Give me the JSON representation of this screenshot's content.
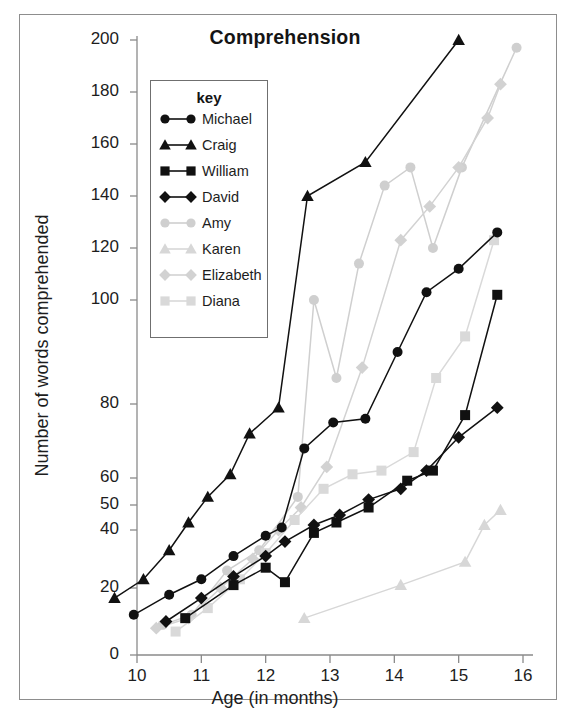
{
  "chart_data": {
    "type": "line",
    "title": "Comprehension",
    "xlabel": "Age (in months)",
    "ylabel": "Number of words comprehended",
    "xlim": [
      9.45,
      16.15
    ],
    "ylim": [
      0,
      200
    ],
    "grid": false,
    "legend_position": "upper-left-inside",
    "legend_title": "key",
    "x_ticks": [
      10,
      11,
      12,
      13,
      14,
      15,
      16
    ],
    "x_tick_labels": [
      "10",
      "11",
      "12",
      "13",
      "14",
      "15",
      "16"
    ],
    "y_ticks": [
      0,
      20,
      40,
      50,
      60,
      80,
      100,
      120,
      140,
      160,
      180,
      200
    ],
    "y_tick_labels": [
      "0",
      "20",
      "40",
      "50",
      "60",
      "80",
      "100",
      "120",
      "140",
      "160",
      "180",
      "200"
    ],
    "y_axis_note": "non-linear spacing, compressed near zero",
    "series": [
      {
        "name": "Michael",
        "marker": "circle",
        "color": "#111111",
        "x": [
          9.95,
          10.5,
          11.0,
          11.5,
          12.0,
          12.25,
          12.6,
          13.05,
          13.55,
          14.05,
          14.5,
          15.0,
          15.6
        ],
        "y": [
          12,
          18,
          23,
          31,
          38,
          41,
          68,
          75,
          76,
          90,
          103,
          112,
          126
        ]
      },
      {
        "name": "Craig",
        "marker": "triangle",
        "color": "#111111",
        "x": [
          9.65,
          10.1,
          10.5,
          10.8,
          11.1,
          11.45,
          11.75,
          12.2,
          12.65,
          13.55,
          15.0
        ],
        "y": [
          17,
          23,
          33,
          43,
          53,
          61,
          72,
          79,
          140,
          153,
          201
        ]
      },
      {
        "name": "William",
        "marker": "square",
        "color": "#111111",
        "x": [
          10.75,
          11.5,
          12.0,
          12.3,
          12.75,
          13.1,
          13.6,
          14.2,
          14.6,
          15.1,
          15.6
        ],
        "y": [
          11,
          21,
          27,
          22,
          39,
          43,
          49,
          59,
          62,
          77,
          102
        ]
      },
      {
        "name": "David",
        "marker": "diamond",
        "color": "#111111",
        "x": [
          10.45,
          11.0,
          11.5,
          12.0,
          12.3,
          12.75,
          13.15,
          13.6,
          14.1,
          14.5,
          15.0,
          15.6
        ],
        "y": [
          10,
          17,
          24,
          31,
          36,
          42,
          46,
          52,
          56,
          62,
          71,
          79
        ]
      },
      {
        "name": "Amy",
        "marker": "circle",
        "color": "#cfcfcf",
        "x": [
          10.4,
          10.85,
          11.4,
          11.9,
          12.5,
          12.75,
          13.1,
          13.45,
          13.85,
          14.25,
          14.6,
          15.05,
          15.9
        ],
        "y": [
          9,
          12,
          26,
          33,
          53,
          100,
          85,
          114,
          144,
          151,
          120,
          151,
          197
        ]
      },
      {
        "name": "Karen",
        "marker": "triangle",
        "color": "#d7d7d7",
        "x": [
          12.6,
          14.1,
          15.1,
          15.4,
          15.65
        ],
        "y": [
          11,
          21,
          29,
          42,
          48
        ]
      },
      {
        "name": "Elizabeth",
        "marker": "diamond",
        "color": "#d2d2d2",
        "x": [
          10.3,
          10.8,
          11.3,
          11.8,
          12.2,
          12.55,
          12.95,
          13.5,
          14.1,
          14.55,
          15.0,
          15.45,
          15.65
        ],
        "y": [
          8,
          11,
          20,
          30,
          40,
          49,
          63,
          87,
          123,
          136,
          151,
          170,
          183
        ]
      },
      {
        "name": "Diana",
        "marker": "square",
        "color": "#d9d9d9",
        "x": [
          10.6,
          11.1,
          11.6,
          12.0,
          12.45,
          12.9,
          13.35,
          13.8,
          14.3,
          14.65,
          15.1,
          15.55
        ],
        "y": [
          7,
          14,
          23,
          32,
          44,
          56,
          61,
          62,
          67,
          85,
          93,
          123
        ]
      }
    ]
  },
  "legend": {
    "title": "key",
    "entries": [
      {
        "label": "Michael",
        "marker": "circle",
        "color": "#111111"
      },
      {
        "label": "Craig",
        "marker": "triangle",
        "color": "#111111"
      },
      {
        "label": "William",
        "marker": "square",
        "color": "#111111"
      },
      {
        "label": "David",
        "marker": "diamond",
        "color": "#111111"
      },
      {
        "label": "Amy",
        "marker": "circle",
        "color": "#cfcfcf"
      },
      {
        "label": "Karen",
        "marker": "triangle",
        "color": "#d7d7d7"
      },
      {
        "label": "Elizabeth",
        "marker": "diamond",
        "color": "#d2d2d2"
      },
      {
        "label": "Diana",
        "marker": "square",
        "color": "#d9d9d9"
      }
    ]
  }
}
